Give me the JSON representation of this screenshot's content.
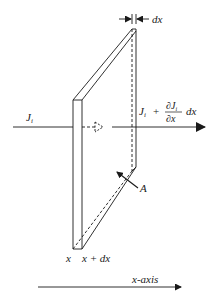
{
  "diagram": {
    "labels": {
      "dx_top": "dx",
      "flux_in": "J",
      "flux_in_sub": "i",
      "flux_out_J": "J",
      "flux_out_sub": "i",
      "flux_out_plus": "+",
      "flux_out_num": "∂J",
      "flux_out_num_sub": "i",
      "flux_out_den": "∂x",
      "flux_out_dx": "dx",
      "area": "A",
      "x": "x",
      "x_plus_dx": "x + dx",
      "axis": "x-axis"
    },
    "colors": {
      "line": "#1a1a1a",
      "background": "#ffffff"
    }
  }
}
